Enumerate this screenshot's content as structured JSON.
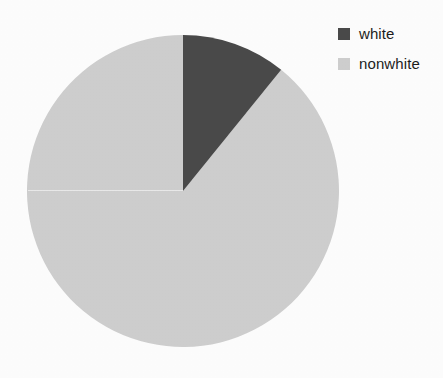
{
  "chart_data": {
    "type": "pie",
    "title": "",
    "subtitle": "",
    "xlabel": "",
    "ylabel": "",
    "grid": false,
    "legend_position": "top-right",
    "start_angle_deg": 0,
    "direction": "clockwise",
    "categories": [
      "white",
      "nonwhite"
    ],
    "values": [
      10.8,
      89.2
    ],
    "slices": [
      {
        "label": "white",
        "value": 10.8,
        "percent": 10.8,
        "angle_deg": 39,
        "color": "#4a4a4a",
        "start_deg": 0,
        "end_deg": 39
      },
      {
        "label": "nonwhite",
        "value": 89.2,
        "percent": 89.2,
        "angle_deg": 321,
        "color": "#cecece",
        "start_deg": 39,
        "end_deg": 360
      }
    ]
  },
  "legend": {
    "items": [
      {
        "label": "white",
        "color": "#4a4a4a",
        "swatch_name": "legend-swatch-white"
      },
      {
        "label": "nonwhite",
        "color": "#cecece",
        "swatch_name": "legend-swatch-nonwhite"
      }
    ]
  },
  "geometry": {
    "center_x": 183,
    "center_y": 191,
    "radius": 156
  },
  "colors": {
    "background": "#fdfdfd",
    "slice_dark": "#4a4a4a",
    "slice_light": "#cecece",
    "text": "#1d1d1d"
  }
}
